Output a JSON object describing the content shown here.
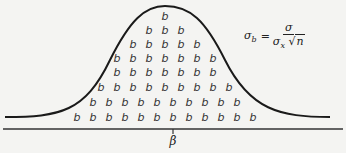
{
  "diagram": {
    "symbol": "b",
    "rows": [
      {
        "count": 1,
        "y": 16
      },
      {
        "count": 3,
        "y": 30
      },
      {
        "count": 5,
        "y": 44
      },
      {
        "count": 7,
        "y": 58
      },
      {
        "count": 7,
        "y": 72
      },
      {
        "count": 9,
        "y": 87
      },
      {
        "count": 10,
        "y": 102
      },
      {
        "count": 12,
        "y": 117
      }
    ],
    "center_x": 165,
    "spacing": 16,
    "axis_label": "β",
    "formula": {
      "lhs": "σ",
      "lhs_sub": "b",
      "equals": "=",
      "numerator": "σ",
      "den_sigma": "σ",
      "den_sub": "x",
      "sqrt_symbol": "√",
      "radicand": "n"
    },
    "colors": {
      "curve": "#1a1a1a",
      "axis": "#333333",
      "symbol": "#333333",
      "background": "#f4f4f2"
    }
  }
}
